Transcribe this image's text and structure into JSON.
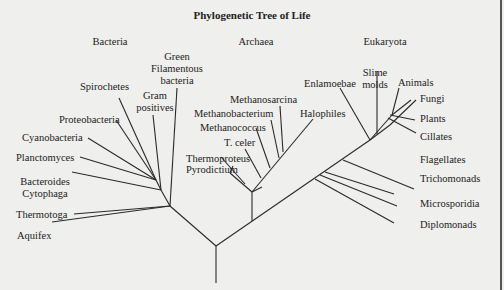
{
  "title": "Phylogenetic Tree of Life",
  "domains": [
    "Bacteria",
    "Archaea",
    "Eukaryota"
  ],
  "bacteria": {
    "green_filamentous": [
      "Green",
      "Filamentous",
      "bacteria"
    ],
    "gram_positives": [
      "Gram",
      "positives"
    ],
    "spirochetes": "Spirochetes",
    "proteobacteria": "Proteobacteria",
    "cyanobacteria": "Cyanobacteria",
    "planctomyces": "Planctomyces",
    "bacteroides": [
      "Bacteroides",
      "Cytophaga"
    ],
    "thermotoga": "Thermotoga",
    "aquifex": "Aquifex"
  },
  "archaea": {
    "methanosarcina": "Methanosarcina",
    "methanobacterium": "Methanobacterium",
    "methanococcus": "Methanococcus",
    "t_celer": "T. celer",
    "thermoproteus": "Thermoproteus",
    "pyrodictium": "Pyrodictium",
    "halophiles": "Halophiles"
  },
  "eukaryota": {
    "enlamoebae": "Enlamoebae",
    "slime_molds": [
      "Slime",
      "molds"
    ],
    "animals": "Animals",
    "fungi": "Fungi",
    "plants": "Plants",
    "cillates": "Cillates",
    "flagellates": "Flagellates",
    "trichomonads": "Trichomonads",
    "microsporidia": "Microsporidia",
    "diplomonads": "Diplomonads"
  }
}
